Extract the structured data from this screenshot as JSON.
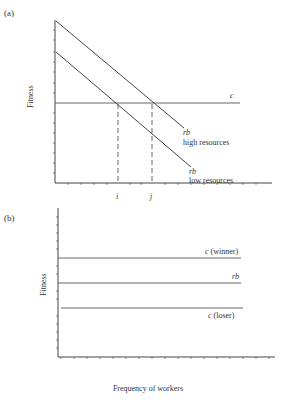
{
  "panel_a": {
    "label": "(a)",
    "ylabel": "Fitness",
    "lines": {
      "c": {
        "label": "c"
      },
      "rb_high": {
        "label_symbol": "rb",
        "label_text": "high resources"
      },
      "rb_low": {
        "label_symbol": "rb",
        "label_text": "low resources"
      }
    },
    "x_markers": [
      {
        "label": "i"
      },
      {
        "label": "j"
      }
    ]
  },
  "panel_b": {
    "label": "(b)",
    "ylabel": "Fitness",
    "lines": {
      "c_winner": {
        "label": "c (winner)",
        "symbol": "c",
        "suffix": " (winner)"
      },
      "rb": {
        "label": "rb"
      },
      "c_loser": {
        "label": "c (loser)",
        "symbol": "c",
        "suffix": " (loser)"
      }
    },
    "xlabel": "Frequency of workers"
  },
  "colors": {
    "ink": "#333333",
    "background": "#ffffff"
  }
}
